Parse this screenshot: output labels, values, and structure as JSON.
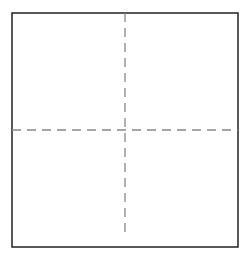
{
  "diagram": {
    "type": "quadrant-grid",
    "frame": {
      "x": 12,
      "y": 13,
      "width": 226,
      "height": 234,
      "stroke": "#222222",
      "stroke_width": 1.5
    },
    "divider_vertical": {
      "x": 125,
      "y1": 13,
      "y2": 238,
      "stroke": "#888888",
      "dash": "9 6"
    },
    "divider_horizontal": {
      "y": 130,
      "x1": 12,
      "x2": 238,
      "stroke": "#888888",
      "dash": "9 6"
    },
    "quadrants": [
      "top-left",
      "top-right",
      "bottom-left",
      "bottom-right"
    ]
  }
}
